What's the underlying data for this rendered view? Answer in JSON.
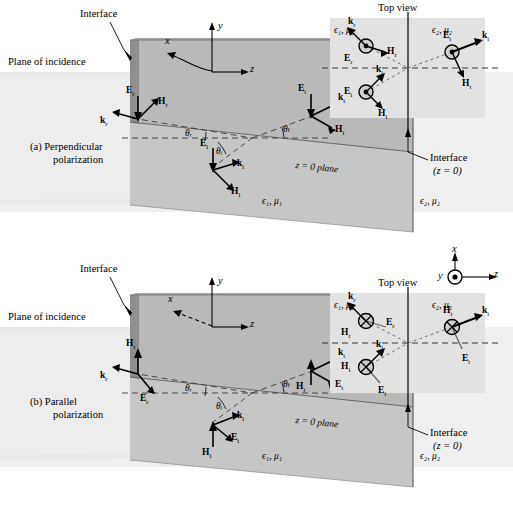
{
  "figure": {
    "type": "physics-diagram"
  },
  "panels": [
    {
      "id": "a",
      "caption_line1": "(a) Perpendicular",
      "caption_line2": "polarization",
      "labels": {
        "interface": "Interface",
        "plane_of_incidence": "Plane of incidence",
        "z_plane": "z = 0 plane",
        "medium1": "ϵ₁, μ₁",
        "medium2": "ϵ₂, μ₂"
      },
      "axes": {
        "x": "x",
        "y": "y",
        "z": "z"
      },
      "angles": {
        "reflected": "θᵣ",
        "incident": "θᵢ",
        "transmitted": "θₜ"
      },
      "vectors": {
        "reflected": {
          "E": "E",
          "E_sub": "r",
          "H": "H",
          "H_sub": "r",
          "k": "k",
          "k_sub": "r"
        },
        "incident": {
          "E": "E",
          "E_sub": "i",
          "H": "H",
          "H_sub": "i",
          "k": "k",
          "k_sub": "i"
        },
        "transmitted": {
          "E": "E",
          "E_sub": "t",
          "H": "H",
          "H_sub": "t",
          "k": "k",
          "k_sub": "t"
        }
      },
      "inset": {
        "title": "Top view",
        "medium1": "ϵ₁, μ₁",
        "medium2": "ϵ₂, μ₂",
        "interface_line1": "Interface",
        "interface_line2": "(z = 0)",
        "field_out_of_page": "E-fields shown as circled dots (out of page)",
        "vectors": {
          "reflected": {
            "E": "E",
            "E_sub": "r",
            "H": "H",
            "H_sub": "r",
            "k": "k",
            "k_sub": "r"
          },
          "incident": {
            "E": "E",
            "E_sub": "i",
            "H": "H",
            "H_sub": "i",
            "k": "k",
            "k_sub": "i"
          },
          "transmitted": {
            "E": "E",
            "E_sub": "t",
            "H": "H",
            "H_sub": "t",
            "k": "k",
            "k_sub": "t"
          }
        }
      }
    },
    {
      "id": "b",
      "caption_line1": "(b) Parallel",
      "caption_line2": "polarization",
      "labels": {
        "interface": "Interface",
        "plane_of_incidence": "Plane of incidence",
        "z_plane": "z = 0 plane",
        "medium1": "ϵ₁, μ₁",
        "medium2": "ϵ₂, μ₂"
      },
      "axes": {
        "x": "x",
        "y": "y",
        "z": "z"
      },
      "angles": {
        "reflected": "θᵣ",
        "incident": "θᵢ",
        "transmitted": "θₜ"
      },
      "vectors": {
        "reflected": {
          "E": "E",
          "E_sub": "r",
          "H": "H",
          "H_sub": "r",
          "k": "k",
          "k_sub": "r"
        },
        "incident": {
          "E": "E",
          "E_sub": "i",
          "H": "H",
          "H_sub": "i",
          "k": "k",
          "k_sub": "i"
        },
        "transmitted": {
          "E": "E",
          "E_sub": "t",
          "H": "H",
          "H_sub": "t",
          "k": "k",
          "k_sub": "t"
        }
      },
      "inset": {
        "title": "Top view",
        "medium1": "ϵ₁, μ₁",
        "medium2": "ϵ₂, μ₂",
        "interface_line1": "Interface",
        "interface_line2": "(z = 0)",
        "field_into_page": "H-fields shown as circled crosses (into page)",
        "axes": {
          "x": "x",
          "y": "y",
          "z": "z"
        },
        "vectors": {
          "reflected": {
            "E": "E",
            "E_sub": "r",
            "H": "H",
            "H_sub": "r",
            "k": "k",
            "k_sub": "r"
          },
          "incident": {
            "E": "E",
            "E_sub": "i",
            "H": "H",
            "H_sub": "i",
            "k": "k",
            "k_sub": "i"
          },
          "transmitted": {
            "E": "E",
            "E_sub": "t",
            "H": "H",
            "H_sub": "t",
            "k": "k",
            "k_sub": "t"
          }
        }
      }
    }
  ],
  "colors": {
    "ink": "#000000",
    "plane_light": "#e4e4e4",
    "plane_mid": "#c9c9c9",
    "plane_dark": "#9f9f9f",
    "inset_bg": "#e0e0e0",
    "dash": "#555555"
  }
}
